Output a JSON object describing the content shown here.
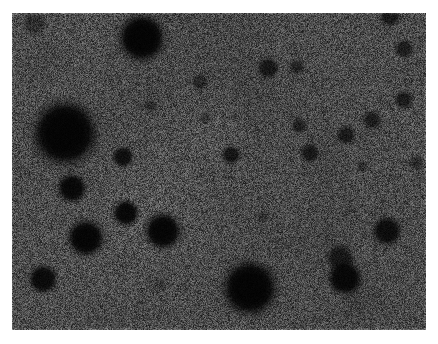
{
  "image": {
    "kind": "transmission-electron-micrograph",
    "subject": "stained nanoparticle dispersion",
    "canvas": {
      "width": 438,
      "height": 344
    },
    "plate": {
      "x": 12,
      "y": 13,
      "width": 414,
      "height": 317
    },
    "background_color": "#7f7f7f",
    "particle_color": "#080808",
    "border_color": "#ffffff",
    "noise": {
      "visible": true,
      "grain": "fine pixel speckle",
      "amplitude": 0.42,
      "cell_px": 1
    },
    "caption_text": "",
    "scalebar_text": ""
  },
  "particles": [
    {
      "id": "p01",
      "cx": 65,
      "cy": 133,
      "r": 24,
      "halo": 16,
      "opacity": 1.0
    },
    {
      "id": "p02",
      "cx": 142,
      "cy": 38,
      "r": 17,
      "halo": 12,
      "opacity": 1.0
    },
    {
      "id": "p03",
      "cx": 250,
      "cy": 288,
      "r": 20,
      "halo": 14,
      "opacity": 1.0
    },
    {
      "id": "p04",
      "cx": 86,
      "cy": 238,
      "r": 13,
      "halo": 10,
      "opacity": 0.98
    },
    {
      "id": "p05",
      "cx": 163,
      "cy": 231,
      "r": 13,
      "halo": 10,
      "opacity": 0.98
    },
    {
      "id": "p06",
      "cx": 126,
      "cy": 213,
      "r": 9,
      "halo": 7,
      "opacity": 0.95
    },
    {
      "id": "p07",
      "cx": 72,
      "cy": 188,
      "r": 10,
      "halo": 8,
      "opacity": 0.95
    },
    {
      "id": "p08",
      "cx": 43,
      "cy": 279,
      "r": 10,
      "halo": 8,
      "opacity": 0.92
    },
    {
      "id": "p09",
      "cx": 345,
      "cy": 278,
      "r": 12,
      "halo": 9,
      "opacity": 0.95
    },
    {
      "id": "p10",
      "cx": 340,
      "cy": 258,
      "r": 9,
      "halo": 8,
      "opacity": 0.7
    },
    {
      "id": "p11",
      "cx": 387,
      "cy": 231,
      "r": 10,
      "halo": 8,
      "opacity": 0.88
    },
    {
      "id": "p12",
      "cx": 123,
      "cy": 157,
      "r": 7,
      "halo": 6,
      "opacity": 0.85
    },
    {
      "id": "p13",
      "cx": 231,
      "cy": 155,
      "r": 6,
      "halo": 6,
      "opacity": 0.78
    },
    {
      "id": "p14",
      "cx": 310,
      "cy": 153,
      "r": 6,
      "halo": 6,
      "opacity": 0.72
    },
    {
      "id": "p15",
      "cx": 346,
      "cy": 135,
      "r": 6,
      "halo": 6,
      "opacity": 0.7
    },
    {
      "id": "p16",
      "cx": 372,
      "cy": 120,
      "r": 6,
      "halo": 6,
      "opacity": 0.66
    },
    {
      "id": "p17",
      "cx": 404,
      "cy": 100,
      "r": 6,
      "halo": 6,
      "opacity": 0.66
    },
    {
      "id": "p18",
      "cx": 299,
      "cy": 126,
      "r": 5,
      "halo": 5,
      "opacity": 0.6
    },
    {
      "id": "p19",
      "cx": 268,
      "cy": 68,
      "r": 7,
      "halo": 6,
      "opacity": 0.72
    },
    {
      "id": "p20",
      "cx": 297,
      "cy": 67,
      "r": 5,
      "halo": 5,
      "opacity": 0.55
    },
    {
      "id": "p21",
      "cx": 390,
      "cy": 16,
      "r": 7,
      "halo": 6,
      "opacity": 0.72
    },
    {
      "id": "p22",
      "cx": 404,
      "cy": 49,
      "r": 6,
      "halo": 6,
      "opacity": 0.66
    },
    {
      "id": "p23",
      "cx": 200,
      "cy": 82,
      "r": 5,
      "halo": 5,
      "opacity": 0.5
    },
    {
      "id": "p24",
      "cx": 151,
      "cy": 106,
      "r": 4,
      "halo": 4,
      "opacity": 0.42
    },
    {
      "id": "p25",
      "cx": 34,
      "cy": 24,
      "r": 8,
      "halo": 7,
      "opacity": 0.4
    },
    {
      "id": "p26",
      "cx": 417,
      "cy": 163,
      "r": 5,
      "halo": 5,
      "opacity": 0.45
    },
    {
      "id": "p27",
      "cx": 362,
      "cy": 167,
      "r": 4,
      "halo": 4,
      "opacity": 0.38
    },
    {
      "id": "p28",
      "cx": 206,
      "cy": 118,
      "r": 4,
      "halo": 4,
      "opacity": 0.35
    },
    {
      "id": "p29",
      "cx": 262,
      "cy": 216,
      "r": 4,
      "halo": 4,
      "opacity": 0.3
    },
    {
      "id": "p30",
      "cx": 160,
      "cy": 283,
      "r": 4,
      "halo": 5,
      "opacity": 0.26
    }
  ]
}
